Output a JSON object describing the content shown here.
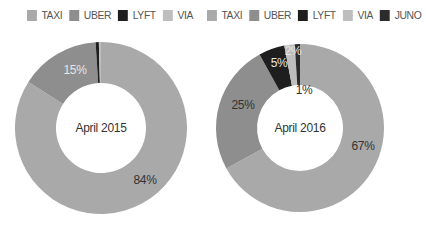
{
  "chart_data": [
    {
      "type": "pie",
      "subtype": "donut",
      "title": "April 2015",
      "center_label": "April 2015",
      "categories": [
        "TAXI",
        "UBER",
        "LYFT",
        "VIA"
      ],
      "values": [
        84,
        15,
        0.6,
        0.4
      ],
      "labels": [
        "84%",
        "15%",
        "",
        ""
      ],
      "colors": [
        "#a9a9a9",
        "#8e8e8e",
        "#1e1e1e",
        "#bebebe"
      ],
      "legend": [
        "TAXI",
        "UBER",
        "LYFT",
        "VIA"
      ],
      "legend_position": "top"
    },
    {
      "type": "pie",
      "subtype": "donut",
      "title": "April 2016",
      "center_label": "April 2016",
      "categories": [
        "TAXI",
        "UBER",
        "LYFT",
        "VIA",
        "JUNO"
      ],
      "values": [
        67,
        25,
        5,
        2,
        1
      ],
      "labels": [
        "67%",
        "25%",
        "5%",
        "2%",
        "1%"
      ],
      "colors": [
        "#a9a9a9",
        "#8e8e8e",
        "#1e1e1e",
        "#bebebe",
        "#2b2b2b"
      ],
      "legend": [
        "TAXI",
        "UBER",
        "LYFT",
        "VIA",
        "JUNO"
      ],
      "legend_position": "top"
    }
  ],
  "legend_left": [
    {
      "label": "TAXI",
      "color": "#a9a9a9"
    },
    {
      "label": "UBER",
      "color": "#8e8e8e"
    },
    {
      "label": "LYFT",
      "color": "#1e1e1e"
    },
    {
      "label": "VIA",
      "color": "#bebebe"
    }
  ],
  "legend_right": [
    {
      "label": "TAXI",
      "color": "#a9a9a9"
    },
    {
      "label": "UBER",
      "color": "#8e8e8e"
    },
    {
      "label": "LYFT",
      "color": "#1e1e1e"
    },
    {
      "label": "VIA",
      "color": "#bebebe"
    },
    {
      "label": "JUNO",
      "color": "#2b2b2b"
    }
  ]
}
